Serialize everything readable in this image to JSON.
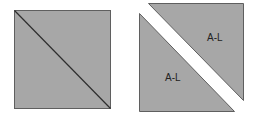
{
  "diagram": {
    "colors": {
      "fill": "#a7a7a7",
      "stroke": "#5f5f5f",
      "background": "#ffffff",
      "label": "#222222"
    },
    "left_square": {
      "description": "Square with diagonal line from top-left to bottom-right"
    },
    "right_pieces": {
      "upper_triangle": {
        "label": "A-L"
      },
      "lower_triangle": {
        "label": "A-L"
      }
    }
  }
}
